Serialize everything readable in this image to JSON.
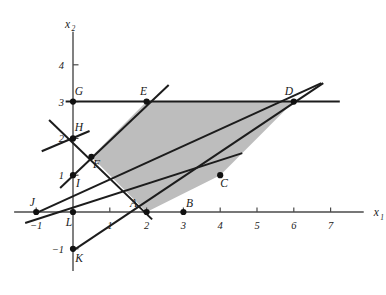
{
  "figure": {
    "title": "",
    "background_color": "#ffffff",
    "region_fill_color": "#bdbdbd",
    "line_color": "#1c1c1c",
    "axis_color": "#4a4a4a"
  },
  "axes": {
    "x": {
      "label": "x",
      "subscript": "1",
      "ticks": [
        -1,
        1,
        2,
        3,
        4,
        5,
        6,
        7
      ],
      "tick_labels": [
        "-1",
        "1",
        "2",
        "3",
        "4",
        "5",
        "6",
        "7"
      ],
      "range": [
        -1.6,
        7.9
      ]
    },
    "y": {
      "label": "x",
      "subscript": "2",
      "ticks": [
        -1,
        1,
        2,
        3,
        4
      ],
      "tick_labels": [
        "-1",
        "1",
        "2",
        "3",
        "4"
      ],
      "range": [
        -1.6,
        4.9
      ]
    }
  },
  "chart_data": {
    "type": "scatter",
    "title": "",
    "xlabel": "x1",
    "ylabel": "x2",
    "xlim": [
      -1.6,
      7.9
    ],
    "ylim": [
      -1.6,
      4.9
    ],
    "grid": false,
    "legend": "none",
    "labeled_points": [
      {
        "name": "A",
        "x": 2,
        "y": 0,
        "label_dx": -13,
        "label_dy": -5
      },
      {
        "name": "B",
        "x": 3,
        "y": 0,
        "label_dx": 6,
        "label_dy": -5
      },
      {
        "name": "C",
        "x": 4,
        "y": 1,
        "label_dx": 4,
        "label_dy": 12
      },
      {
        "name": "D",
        "x": 6,
        "y": 3,
        "label_dx": -5,
        "label_dy": -7
      },
      {
        "name": "E",
        "x": 2,
        "y": 3,
        "label_dx": -3,
        "label_dy": -7
      },
      {
        "name": "F",
        "x": 0.5,
        "y": 1.5,
        "label_dx": 5,
        "label_dy": 11
      },
      {
        "name": "G",
        "x": 0,
        "y": 3,
        "label_dx": 6,
        "label_dy": -7
      },
      {
        "name": "H",
        "x": 0,
        "y": 2,
        "label_dx": 6,
        "label_dy": -7
      },
      {
        "name": "I",
        "x": 0,
        "y": 1,
        "label_dx": 5,
        "label_dy": 12
      },
      {
        "name": "J",
        "x": -1,
        "y": 0,
        "label_dx": -4,
        "label_dy": -6
      },
      {
        "name": "K",
        "x": 0,
        "y": -1,
        "label_dx": 6,
        "label_dy": 13
      },
      {
        "name": "L",
        "x": 0,
        "y": 0,
        "label_dx": -4,
        "label_dy": 14
      }
    ],
    "feasible_region": {
      "name": "shaded-feasible-region",
      "vertices": [
        {
          "x": 2,
          "y": 3
        },
        {
          "x": 6,
          "y": 3
        },
        {
          "x": 4,
          "y": 1
        },
        {
          "x": 2,
          "y": 0
        },
        {
          "x": 0.5,
          "y": 1.5
        }
      ]
    },
    "constraint_lines": [
      {
        "name": "horizontal-line-x2-equals-3",
        "x1": -0.2,
        "y1": 3,
        "x2": 7.25,
        "y2": 3
      },
      {
        "name": "line-through-G-E-C-B",
        "x1": -1.3,
        "y1": -0.3,
        "x2": 4.6,
        "y2": 1.6
      },
      {
        "name": "line-through-J-F-E-D",
        "x1": -1.05,
        "y1": -0.05,
        "x2": 6.75,
        "y2": 3.5
      },
      {
        "name": "line-through-K-A-C-D",
        "x1": 0.0,
        "y1": -1.05,
        "x2": 6.8,
        "y2": 3.5
      },
      {
        "name": "line-through-I-F-H-E",
        "x1": -0.35,
        "y1": 0.65,
        "x2": 2.6,
        "y2": 3.45
      },
      {
        "name": "line-through-H-F-A",
        "x1": -0.65,
        "y1": 2.5,
        "x2": 2.15,
        "y2": -0.2
      },
      {
        "name": "line-segment-upper-left-at-H",
        "x1": -0.85,
        "y1": 1.65,
        "x2": 0.45,
        "y2": 2.2
      }
    ]
  }
}
